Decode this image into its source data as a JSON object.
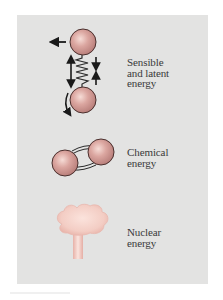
{
  "figure": {
    "background_color": "#e3e3e2",
    "sphere_color": "#d9a29d",
    "sphere_outline": "#5a3a38",
    "cloud_color": "#f3cfc7",
    "items": [
      {
        "id": "sensible-latent",
        "icon": "vibrating-molecule-icon",
        "lines": [
          "Sensible",
          "and latent",
          "energy"
        ]
      },
      {
        "id": "chemical",
        "icon": "bonded-atoms-icon",
        "lines": [
          "Chemical",
          "energy"
        ]
      },
      {
        "id": "nuclear",
        "icon": "mushroom-cloud-icon",
        "lines": [
          "Nuclear",
          "energy"
        ]
      }
    ]
  }
}
